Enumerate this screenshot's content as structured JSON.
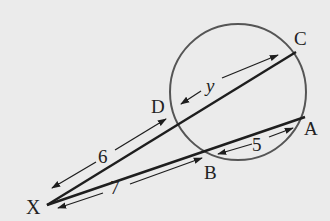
{
  "diagram": {
    "type": "intersecting-secants",
    "colors": {
      "background": "#ebebeb",
      "line": "#1e1e1e",
      "circle": "#555555",
      "text": "#222222"
    },
    "points": {
      "X": {
        "label": "X",
        "x": 47,
        "y": 205
      },
      "D": {
        "label": "D",
        "x": 176,
        "y": 116
      },
      "C": {
        "label": "C",
        "x": 296,
        "y": 52
      },
      "B": {
        "label": "B",
        "x": 204,
        "y": 152
      },
      "A": {
        "label": "A",
        "x": 305,
        "y": 117
      }
    },
    "circle": {
      "cx": 238,
      "cy": 92,
      "r": 68
    },
    "measures": {
      "XD": "6",
      "DC": "y",
      "XB": "7",
      "BA": "5"
    }
  }
}
